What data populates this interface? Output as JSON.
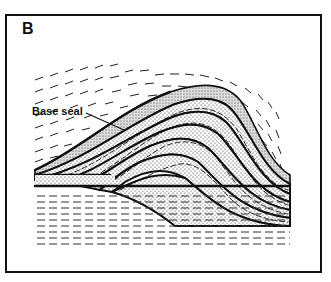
{
  "figure": {
    "panel_label": "B",
    "callouts": [
      {
        "label": "Base seal"
      }
    ]
  }
}
